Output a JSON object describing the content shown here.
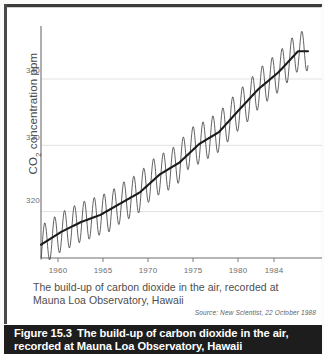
{
  "figure": {
    "number_label": "Figure 15.3",
    "caption_line1": "The build-up of carbon dioxide in the air,",
    "caption_line2": "recorded at Mauna Loa Observatory, Hawaii",
    "subcaption_line1": "The build-up of carbon dioxide in the air, recorded at",
    "subcaption_line2": "Mauna Loa Observatory, Hawaii",
    "source": "Source: New Scientist, 22 October 1988",
    "caption_bar_color": "#1d1d1d",
    "caption_text_color": "#ffffff"
  },
  "chart_data": {
    "type": "line",
    "title": "The build-up of carbon dioxide in the air, recorded at Mauna Loa Observatory, Hawaii",
    "xlabel": "",
    "ylabel": "CO2 concentration ppm",
    "ylabel_html": "CO<sub>2</sub> concentration ppm",
    "xlim": [
      1958,
      1985
    ],
    "ylim": [
      313,
      348
    ],
    "ytick_values": [
      320,
      330,
      340
    ],
    "ytick_labels": [
      "320",
      "330",
      "340"
    ],
    "xtick_values": [
      1960,
      1965,
      1970,
      1975,
      1980,
      1984
    ],
    "xtick_labels": [
      "1960",
      "1965",
      "1970",
      "1975",
      "1980",
      "1984"
    ],
    "grid": "horizontal",
    "legend": "none",
    "line_color": "#3a3a3a",
    "trend_color": "#1a1a1a",
    "series": [
      {
        "name": "Monthly mean CO2 (seasonal cycle)",
        "description": "Sawtooth monthly record with annual oscillation of about 6 ppm peak-to-trough",
        "seasonal_amplitude_ppm": 3.0,
        "x": [
          1958,
          1959,
          1960,
          1961,
          1962,
          1963,
          1964,
          1965,
          1966,
          1967,
          1968,
          1969,
          1970,
          1971,
          1972,
          1973,
          1974,
          1975,
          1976,
          1977,
          1978,
          1979,
          1980,
          1981,
          1982,
          1983,
          1984
        ],
        "values": [
          315.0,
          315.8,
          316.9,
          317.6,
          318.4,
          318.9,
          319.5,
          320.0,
          321.2,
          322.0,
          322.9,
          324.6,
          325.6,
          326.3,
          327.4,
          329.6,
          330.2,
          331.1,
          332.0,
          333.7,
          335.3,
          336.7,
          338.5,
          339.8,
          341.0,
          342.6,
          344.2
        ]
      },
      {
        "name": "Smoothed trend",
        "description": "Heavy dark line through the centre of the oscillation",
        "x": [
          1958,
          1960,
          1962,
          1964,
          1966,
          1968,
          1970,
          1972,
          1974,
          1976,
          1978,
          1980,
          1982,
          1984
        ],
        "values": [
          315.0,
          316.9,
          318.4,
          319.5,
          321.2,
          322.9,
          325.6,
          327.4,
          330.2,
          332.0,
          335.3,
          338.5,
          341.0,
          344.2
        ]
      }
    ]
  }
}
